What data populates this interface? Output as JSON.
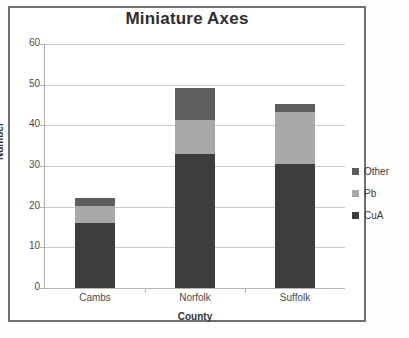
{
  "chart_data": {
    "type": "bar",
    "subtype": "stacked-bar",
    "title": "Miniature Axes",
    "xlabel": "County",
    "ylabel": "Number",
    "categories": [
      "Cambs",
      "Norfolk",
      "Suffolk"
    ],
    "series": [
      {
        "name": "CuA",
        "values": [
          16,
          33,
          30.5
        ],
        "color": "#3d3d3d"
      },
      {
        "name": "Pb",
        "values": [
          4.2,
          8.3,
          12.7
        ],
        "color": "#a8a8a8"
      },
      {
        "name": "Other",
        "values": [
          2,
          8,
          2
        ],
        "color": "#5e5e5e"
      }
    ],
    "totals": [
      22.2,
      49.3,
      45.2
    ],
    "ylim": [
      0,
      60
    ],
    "yticks": [
      0,
      10,
      20,
      30,
      40,
      50,
      60
    ],
    "ytick_labels": [
      "0",
      "10",
      "20",
      "30",
      "40",
      "50",
      "60"
    ],
    "grid": true,
    "legend_position": "right",
    "legend_entries": [
      "Other",
      "Pb",
      "CuA"
    ]
  },
  "legend": {
    "items": [
      {
        "label": "Other",
        "color": "#5e5e5e"
      },
      {
        "label": "Pb",
        "color": "#a8a8a8"
      },
      {
        "label": "CuA",
        "color": "#3d3d3d"
      }
    ]
  }
}
